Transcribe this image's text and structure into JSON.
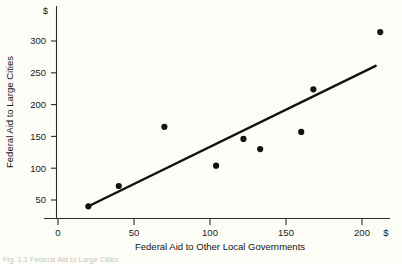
{
  "figure": {
    "background_color": "#fdfdf8",
    "ink_color": "#111110",
    "caption": "Fig. 1.1 Federal Aid to Large Cities"
  },
  "chart_data": {
    "type": "scatter",
    "title": "",
    "xlabel": "Federal Aid to Other Local Governments",
    "ylabel": "Federal Aid to Large Cities",
    "x_unit_symbol": "$",
    "y_unit_symbol": "$",
    "xlim": [
      0,
      215
    ],
    "ylim": [
      30,
      320
    ],
    "grid": false,
    "legend": null,
    "x_ticks": [
      0,
      50,
      100,
      150,
      200
    ],
    "x_ticklabels": [
      "0",
      "50",
      "100",
      "150",
      "200"
    ],
    "y_ticks": [
      50,
      100,
      150,
      200,
      250,
      300
    ],
    "y_ticklabels": [
      "50",
      "100",
      "150",
      "200",
      "250",
      "300"
    ],
    "points": [
      {
        "x": 20,
        "y": 40
      },
      {
        "x": 40,
        "y": 72
      },
      {
        "x": 70,
        "y": 165
      },
      {
        "x": 104,
        "y": 104
      },
      {
        "x": 122,
        "y": 146
      },
      {
        "x": 133,
        "y": 130
      },
      {
        "x": 160,
        "y": 157
      },
      {
        "x": 168,
        "y": 224
      },
      {
        "x": 212,
        "y": 314
      }
    ],
    "fit_line": {
      "label": "regression line",
      "x_start": 19,
      "y_start": 39,
      "x_end": 209,
      "y_end": 261
    }
  }
}
